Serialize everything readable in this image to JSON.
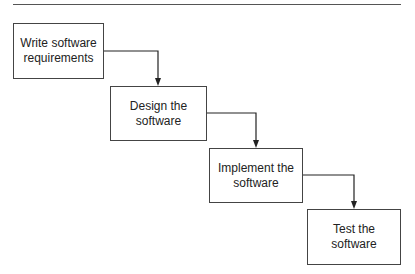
{
  "diagram": {
    "type": "waterfall-flowchart",
    "steps": [
      {
        "line1": "Write software",
        "line2": "requirements"
      },
      {
        "line1": "Design the",
        "line2": "software"
      },
      {
        "line1": "Implement the",
        "line2": "software"
      },
      {
        "line1": "Test the",
        "line2": "software"
      }
    ],
    "edges": [
      {
        "from": 0,
        "to": 1
      },
      {
        "from": 1,
        "to": 2
      },
      {
        "from": 2,
        "to": 3
      }
    ],
    "colors": {
      "stroke": "#444444",
      "text": "#222222",
      "background": "#ffffff"
    }
  }
}
